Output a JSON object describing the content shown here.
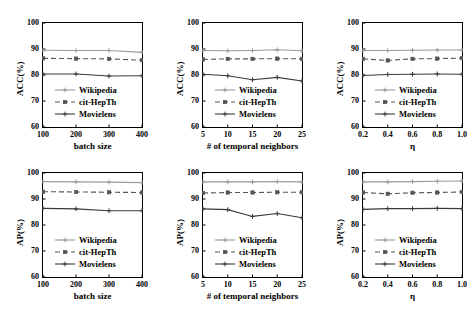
{
  "figure": {
    "rows": 2,
    "cols": 3,
    "background": "#ffffff"
  },
  "series_style": {
    "Wikipedia": {
      "color": "#9a9a9a",
      "dash": "none",
      "marker": "plus"
    },
    "cit-HepTh": {
      "color": "#555555",
      "dash": "5,3",
      "marker": "square"
    },
    "Movielens": {
      "color": "#3a3a3a",
      "dash": "none",
      "marker": "plus"
    }
  },
  "legend_labels": [
    "Wikipedia",
    "cit-HepTh",
    "Movielens"
  ],
  "chart_data": [
    {
      "id": "acc-batch-size",
      "type": "line",
      "title": "",
      "xlabel": "batch size",
      "ylabel": "ACC(%)",
      "x": [
        100,
        200,
        300,
        400
      ],
      "xticks": [
        "100",
        "200",
        "300",
        "400"
      ],
      "xlim": [
        100,
        400
      ],
      "ylim": [
        60,
        100
      ],
      "yticks": [
        "60",
        "70",
        "80",
        "90",
        "100"
      ],
      "grid": false,
      "legend_position": "lower-left",
      "series": [
        {
          "name": "Wikipedia",
          "values": [
            89.5,
            89.4,
            89.4,
            88.7
          ]
        },
        {
          "name": "cit-HepTh",
          "values": [
            86.4,
            86.3,
            86.2,
            85.7
          ]
        },
        {
          "name": "Movielens",
          "values": [
            80.4,
            80.4,
            79.6,
            79.7
          ]
        }
      ]
    },
    {
      "id": "acc-temporal-neighbors",
      "type": "line",
      "title": "",
      "xlabel": "# of temporal neighbors",
      "ylabel": "ACC(%)",
      "x": [
        5,
        10,
        15,
        20,
        25
      ],
      "xticks": [
        "5",
        "10",
        "15",
        "20",
        "25"
      ],
      "xlim": [
        5,
        25
      ],
      "ylim": [
        60,
        100
      ],
      "yticks": [
        "60",
        "70",
        "80",
        "90",
        "100"
      ],
      "grid": false,
      "legend_position": "lower-left",
      "series": [
        {
          "name": "Wikipedia",
          "values": [
            89.4,
            89.3,
            89.4,
            89.7,
            89.3
          ]
        },
        {
          "name": "cit-HepTh",
          "values": [
            86.0,
            86.2,
            86.2,
            86.3,
            86.2
          ]
        },
        {
          "name": "Movielens",
          "values": [
            80.3,
            79.7,
            78.2,
            79.1,
            77.7
          ]
        }
      ]
    },
    {
      "id": "acc-eta",
      "type": "line",
      "title": "",
      "xlabel": "η",
      "ylabel": "ACC(%)",
      "x": [
        0.2,
        0.4,
        0.6,
        0.8,
        1.0
      ],
      "xticks": [
        "0.2",
        "0.4",
        "0.6",
        "0.8",
        "1.0"
      ],
      "xlim": [
        0.2,
        1.0
      ],
      "ylim": [
        60,
        100
      ],
      "yticks": [
        "60",
        "70",
        "80",
        "90",
        "100"
      ],
      "grid": false,
      "legend_position": "lower-left",
      "series": [
        {
          "name": "Wikipedia",
          "values": [
            89.4,
            89.4,
            89.5,
            89.6,
            89.6
          ]
        },
        {
          "name": "cit-HepTh",
          "values": [
            86.2,
            85.6,
            86.2,
            86.3,
            86.5
          ]
        },
        {
          "name": "Movielens",
          "values": [
            79.8,
            80.2,
            80.3,
            80.4,
            80.3
          ]
        }
      ]
    },
    {
      "id": "ap-batch-size",
      "type": "line",
      "title": "",
      "xlabel": "batch size",
      "ylabel": "AP(%)",
      "x": [
        100,
        200,
        300,
        400
      ],
      "xticks": [
        "100",
        "200",
        "300",
        "400"
      ],
      "xlim": [
        100,
        400
      ],
      "ylim": [
        60,
        100
      ],
      "yticks": [
        "60",
        "70",
        "80",
        "90",
        "100"
      ],
      "grid": false,
      "legend_position": "lower-left",
      "series": [
        {
          "name": "Wikipedia",
          "values": [
            96.7,
            96.6,
            96.5,
            96.3
          ]
        },
        {
          "name": "cit-HepTh",
          "values": [
            92.8,
            92.7,
            92.6,
            92.5
          ]
        },
        {
          "name": "Movielens",
          "values": [
            86.4,
            86.2,
            85.5,
            85.5
          ]
        }
      ]
    },
    {
      "id": "ap-temporal-neighbors",
      "type": "line",
      "title": "",
      "xlabel": "# of temporal neighbors",
      "ylabel": "AP(%)",
      "x": [
        5,
        10,
        15,
        20,
        25
      ],
      "xticks": [
        "5",
        "10",
        "15",
        "20",
        "25"
      ],
      "xlim": [
        5,
        25
      ],
      "ylim": [
        60,
        100
      ],
      "yticks": [
        "60",
        "70",
        "80",
        "90",
        "100"
      ],
      "grid": false,
      "legend_position": "lower-left",
      "series": [
        {
          "name": "Wikipedia",
          "values": [
            96.6,
            96.6,
            96.6,
            96.7,
            96.6
          ]
        },
        {
          "name": "cit-HepTh",
          "values": [
            92.3,
            92.5,
            92.5,
            92.6,
            92.6
          ]
        },
        {
          "name": "Movielens",
          "values": [
            86.2,
            85.9,
            83.3,
            84.4,
            82.8
          ]
        }
      ]
    },
    {
      "id": "ap-eta",
      "type": "line",
      "title": "",
      "xlabel": "η",
      "ylabel": "AP(%)",
      "x": [
        0.2,
        0.4,
        0.6,
        0.8,
        1.0
      ],
      "xticks": [
        "0.2",
        "0.4",
        "0.6",
        "0.8",
        "1.0"
      ],
      "xlim": [
        0.2,
        1.0
      ],
      "ylim": [
        60,
        100
      ],
      "yticks": [
        "60",
        "70",
        "80",
        "90",
        "100"
      ],
      "grid": false,
      "legend_position": "lower-left",
      "series": [
        {
          "name": "Wikipedia",
          "values": [
            96.6,
            96.6,
            96.7,
            96.8,
            96.9
          ]
        },
        {
          "name": "cit-HepTh",
          "values": [
            92.5,
            92.0,
            92.4,
            92.5,
            92.7
          ]
        },
        {
          "name": "Movielens",
          "values": [
            86.0,
            86.3,
            86.3,
            86.4,
            86.3
          ]
        }
      ]
    }
  ]
}
